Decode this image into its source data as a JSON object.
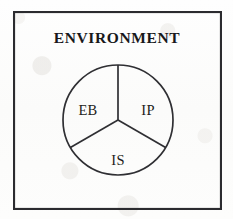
{
  "figure": {
    "title": "ENVIRONMENT",
    "frame": {
      "x": 13,
      "y": 11,
      "width": 208,
      "height": 198,
      "stroke_color": "#2b2b2f"
    },
    "circle": {
      "center_x": 118,
      "center_y": 120,
      "radius": 55,
      "stroke_color": "#2f2f33"
    },
    "sectors": [
      {
        "id": "eb",
        "label": "EB",
        "label_x": 88,
        "label_y": 115,
        "position": "left"
      },
      {
        "id": "ip",
        "label": "IP",
        "label_x": 148,
        "label_y": 115,
        "position": "right"
      },
      {
        "id": "is",
        "label": "IS",
        "label_x": 118,
        "label_y": 165,
        "position": "bottom"
      }
    ],
    "dividers": [
      {
        "id": "divider-up",
        "angle_deg": 90,
        "x2": 118,
        "y2": 65
      },
      {
        "id": "divider-down-left",
        "angle_deg": 210,
        "x2": 70.4,
        "y2": 147.5
      },
      {
        "id": "divider-down-right",
        "angle_deg": 330,
        "x2": 165.6,
        "y2": 147.5
      }
    ],
    "title_x": 117,
    "title_y": 43
  }
}
